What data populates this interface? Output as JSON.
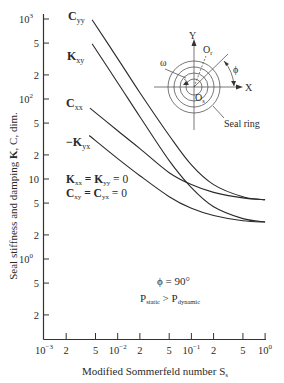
{
  "chart_data": {
    "type": "line",
    "title": "",
    "xlabel": "Modified Sommerfeld number S",
    "xlabel_subscript": "s",
    "ylabel": "Seal stiffness and damping K, C, dim.",
    "xscale": "log",
    "yscale": "log",
    "xlim": [
      0.001,
      1
    ],
    "ylim": [
      0.1,
      1000
    ],
    "x_ticks": [
      {
        "value": 0.001,
        "label": "10",
        "sup": "−3"
      },
      {
        "value": 0.002,
        "label": "2",
        "sup": ""
      },
      {
        "value": 0.005,
        "label": "5",
        "sup": ""
      },
      {
        "value": 0.01,
        "label": "10",
        "sup": "−2"
      },
      {
        "value": 0.02,
        "label": "2",
        "sup": ""
      },
      {
        "value": 0.05,
        "label": "5",
        "sup": ""
      },
      {
        "value": 0.1,
        "label": "10",
        "sup": "−1"
      },
      {
        "value": 0.2,
        "label": "2",
        "sup": ""
      },
      {
        "value": 0.5,
        "label": "5",
        "sup": ""
      },
      {
        "value": 1,
        "label": "10",
        "sup": "0"
      }
    ],
    "y_ticks": [
      {
        "value": 1000,
        "label": "10",
        "sup": "3"
      },
      {
        "value": 500,
        "label": "5",
        "sup": ""
      },
      {
        "value": 200,
        "label": "2",
        "sup": ""
      },
      {
        "value": 100,
        "label": "10",
        "sup": "2"
      },
      {
        "value": 50,
        "label": "5",
        "sup": ""
      },
      {
        "value": 20,
        "label": "2",
        "sup": ""
      },
      {
        "value": 10,
        "label": "10",
        "sup": ""
      },
      {
        "value": 5,
        "label": "5",
        "sup": ""
      },
      {
        "value": 2,
        "label": "2",
        "sup": ""
      },
      {
        "value": 1,
        "label": "10",
        "sup": "0"
      },
      {
        "value": 0.5,
        "label": "5",
        "sup": ""
      },
      {
        "value": 0.2,
        "label": "2",
        "sup": ""
      }
    ],
    "grid": false,
    "series": [
      {
        "name": "Cyy",
        "label_main": "C",
        "label_sub": "yy",
        "x": [
          0.0045,
          0.01,
          0.02,
          0.05,
          0.1,
          0.2,
          0.5,
          1.0
        ],
        "y": [
          980,
          320,
          120,
          35,
          15,
          8.5,
          6.0,
          5.5
        ]
      },
      {
        "name": "Kxy",
        "label_main": "K",
        "label_sub": "xy",
        "x": [
          0.0045,
          0.01,
          0.02,
          0.05,
          0.1,
          0.2,
          0.5,
          1.0
        ],
        "y": [
          490,
          160,
          60,
          17,
          7.8,
          4.5,
          3.2,
          2.9
        ]
      },
      {
        "name": "Cxx",
        "label_main": "C",
        "label_sub": "xx",
        "x": [
          0.0042,
          0.01,
          0.02,
          0.05,
          0.1,
          0.2,
          0.5,
          1.0
        ],
        "y": [
          77,
          40,
          24,
          12,
          8.5,
          6.8,
          5.8,
          5.5
        ]
      },
      {
        "name": "-Kyx",
        "label_main": "−K",
        "label_sub": "yx",
        "x": [
          0.0041,
          0.01,
          0.02,
          0.05,
          0.1,
          0.2,
          0.5,
          1.0
        ],
        "y": [
          35,
          18,
          11,
          6.0,
          4.3,
          3.5,
          3.0,
          2.9
        ]
      }
    ],
    "annotations": [
      {
        "text": "Kxx = Kyy = 0"
      },
      {
        "text": "Cxy = Cyx = 0"
      },
      {
        "text": "φ = 90°"
      },
      {
        "text": "Pstatic > Pdynamic"
      }
    ],
    "inset": {
      "labels": {
        "y": "Y",
        "x": "X",
        "orbit_center": "O",
        "orbit_center_sub": "r",
        "origin": "O",
        "origin_sub": "s",
        "omega": "ω",
        "phi": "φ",
        "seal_ring": "Seal ring"
      }
    }
  },
  "labels": {
    "cyy": {
      "main": "C",
      "sub": "yy"
    },
    "kxy": {
      "main": "K",
      "sub": "xy"
    },
    "cxx": {
      "main": "C",
      "sub": "xx"
    },
    "kyx": {
      "main": "−K",
      "sub": "yx"
    },
    "zero1": "K",
    "zero1_sub_a": "xx",
    "zero1_mid": " = K",
    "zero1_sub_b": "yy",
    "zero1_end": " = 0",
    "zero2": "C",
    "zero2_sub_a": "xy",
    "zero2_mid": " = C",
    "zero2_sub_b": "yx",
    "zero2_end": " = 0",
    "phi_text": "ϕ = 90°",
    "p_main1": "P",
    "p_sub1": "static",
    "p_gt": " > P",
    "p_sub2": "dynamic"
  },
  "axes": {
    "ylabel_pre": "Seal stiffness and damping ",
    "ylabel_bold": "K",
    "ylabel_post": ", C, dim.",
    "xlabel_main": "Modified Sommerfeld number S",
    "xlabel_sub": "s"
  },
  "inset": {
    "y": "Y",
    "x": "X",
    "or": "O",
    "or_sub": "r",
    "os": "O",
    "os_sub": "s",
    "omega": "ω",
    "phi": "ϕ",
    "seal_ring": "Seal ring"
  }
}
